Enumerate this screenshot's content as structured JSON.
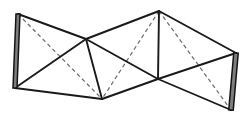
{
  "figure": {
    "canvas": {
      "width": 247,
      "height": 123
    },
    "colors": {
      "background": "#ffffff",
      "solid_edge": "#1a1a1a",
      "hidden_edge": "#6e6e6e",
      "band_fill": "#7d7d7d",
      "band_outline": "#141414"
    },
    "stroke_widths": {
      "solid_edge": 1.9,
      "hidden_edge": 1.25,
      "band_outline": 1.5
    },
    "dash_pattern": "4 3",
    "vertices": [
      {
        "id": "A",
        "name": "top-left-apex",
        "x": 18,
        "y": 14
      },
      {
        "id": "B",
        "name": "bottom-left-apex",
        "x": 15,
        "y": 88
      },
      {
        "id": "C",
        "name": "center-upper-node",
        "x": 86,
        "y": 39
      },
      {
        "id": "D",
        "name": "bottom-center-node",
        "x": 102,
        "y": 99
      },
      {
        "id": "E",
        "name": "top-right-apex",
        "x": 159,
        "y": 11
      },
      {
        "id": "F",
        "name": "center-right-node",
        "x": 158,
        "y": 79
      },
      {
        "id": "G",
        "name": "right-upper-apex",
        "x": 236,
        "y": 53
      },
      {
        "id": "H",
        "name": "bottom-right-apex",
        "x": 231,
        "y": 110
      }
    ],
    "solid_edges": [
      {
        "name": "edge-A-C",
        "from": "A",
        "to": "C"
      },
      {
        "name": "edge-A-B-chord",
        "from": "A",
        "to": "B"
      },
      {
        "name": "edge-B-C",
        "from": "B",
        "to": "C"
      },
      {
        "name": "edge-B-D",
        "from": "B",
        "to": "D"
      },
      {
        "name": "edge-C-D",
        "from": "C",
        "to": "D"
      },
      {
        "name": "edge-C-E",
        "from": "C",
        "to": "E"
      },
      {
        "name": "edge-C-F",
        "from": "C",
        "to": "F"
      },
      {
        "name": "edge-D-F",
        "from": "D",
        "to": "F"
      },
      {
        "name": "edge-E-F",
        "from": "E",
        "to": "F"
      },
      {
        "name": "edge-E-G",
        "from": "E",
        "to": "G"
      },
      {
        "name": "edge-F-G",
        "from": "F",
        "to": "G"
      },
      {
        "name": "edge-F-H",
        "from": "F",
        "to": "H"
      },
      {
        "name": "edge-G-H",
        "from": "G",
        "to": "H"
      }
    ],
    "hidden_edges": [
      {
        "name": "diagonal-A-D",
        "from": "A",
        "to": "D"
      },
      {
        "name": "diagonal-E-D",
        "from": "E",
        "to": "D"
      },
      {
        "name": "diagonal-E-H",
        "from": "E",
        "to": "H"
      }
    ],
    "shaded_bands": [
      {
        "name": "left-fold-band",
        "from": "A",
        "to": "B",
        "width": 4.0
      },
      {
        "name": "right-fold-band",
        "from": "G",
        "to": "H",
        "width": 4.5
      }
    ],
    "panels": [
      {
        "name": "panel-left",
        "vertices": [
          "A",
          "B",
          "D",
          "C"
        ]
      },
      {
        "name": "panel-center-left",
        "vertices": [
          "C",
          "D",
          "F",
          "E"
        ]
      },
      {
        "name": "panel-right",
        "vertices": [
          "E",
          "F",
          "H",
          "G"
        ]
      }
    ]
  }
}
